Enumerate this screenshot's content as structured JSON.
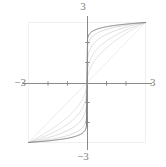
{
  "figure": {
    "title": "",
    "frame_color": "#f2f2f2",
    "axis_color": "#808080",
    "curve_color": "#c8c8c8",
    "highlight_curve_color": "#6e6e6e",
    "diagonal_color": "#e0e0e0",
    "background": "#ffffff"
  },
  "labels": {
    "x_min": "−3",
    "x_max": "3",
    "y_min": "−3",
    "y_max": "3"
  },
  "chart_data": {
    "type": "line",
    "title": "",
    "xlabel": "",
    "ylabel": "",
    "xlim": [
      -3,
      3
    ],
    "ylim": [
      -3,
      3
    ],
    "grid": false,
    "legend": null,
    "x_ticks": [
      -2,
      -1,
      1,
      2
    ],
    "y_ticks": [
      -2,
      -1,
      1,
      2
    ],
    "tick_labels_shown": [
      "-3",
      "3",
      "-3",
      "3"
    ],
    "series": [
      {
        "name": "diagonal y = x",
        "style": "solid",
        "color": "#e4e4e4",
        "width": 0.7,
        "x": [
          -3,
          3
        ],
        "values": [
          -3,
          3
        ]
      },
      {
        "name": "n = 2",
        "style": "solid",
        "color": "#d4d4d4",
        "width": 0.7,
        "exponent": 0.5,
        "x": [
          -3.0,
          -2.7,
          -2.4,
          -2.1,
          -1.8,
          -1.5,
          -1.2,
          -0.9,
          -0.6,
          -0.3,
          0.0,
          0.3,
          0.6,
          0.9,
          1.2,
          1.5,
          1.8,
          2.1,
          2.4,
          2.7,
          3.0
        ],
        "values": [
          -3.0,
          -2.846,
          -2.683,
          -2.51,
          -2.324,
          -2.121,
          -1.897,
          -1.643,
          -1.342,
          -0.949,
          0.0,
          0.949,
          1.342,
          1.643,
          1.897,
          2.121,
          2.324,
          2.51,
          2.683,
          2.846,
          3.0
        ]
      },
      {
        "name": "n = 3",
        "style": "solid",
        "color": "#cfcfcf",
        "width": 0.7,
        "exponent": 0.3333,
        "x": [
          -3.0,
          -2.7,
          -2.4,
          -2.1,
          -1.8,
          -1.5,
          -1.2,
          -0.9,
          -0.6,
          -0.3,
          0.0,
          0.3,
          0.6,
          0.9,
          1.2,
          1.5,
          1.8,
          2.1,
          2.4,
          2.7,
          3.0
        ],
        "values": [
          -3.0,
          -2.898,
          -2.786,
          -2.663,
          -2.525,
          -2.369,
          -2.188,
          -1.97,
          -1.692,
          -1.284,
          0.0,
          1.284,
          1.692,
          1.97,
          2.188,
          2.369,
          2.525,
          2.663,
          2.786,
          2.898,
          3.0
        ]
      },
      {
        "name": "n = 5",
        "style": "solid",
        "color": "#c9c9c9",
        "width": 0.7,
        "exponent": 0.2,
        "x": [
          -3.0,
          -2.7,
          -2.4,
          -2.1,
          -1.8,
          -1.5,
          -1.2,
          -0.9,
          -0.6,
          -0.3,
          0.0,
          0.3,
          0.6,
          0.9,
          1.2,
          1.5,
          1.8,
          2.1,
          2.4,
          2.7,
          3.0
        ],
        "values": [
          -3.0,
          -2.938,
          -2.869,
          -2.792,
          -2.704,
          -2.6,
          -2.475,
          -2.317,
          -2.099,
          -1.748,
          0.0,
          1.748,
          2.099,
          2.317,
          2.475,
          2.6,
          2.704,
          2.792,
          2.869,
          2.938,
          3.0
        ]
      },
      {
        "name": "n = 9",
        "style": "solid",
        "color": "#c4c4c4",
        "width": 0.7,
        "exponent": 0.1111,
        "x": [
          -3.0,
          -2.7,
          -2.4,
          -2.1,
          -1.8,
          -1.5,
          -1.2,
          -0.9,
          -0.6,
          -0.3,
          0.0,
          0.3,
          0.6,
          0.9,
          1.2,
          1.5,
          1.8,
          2.1,
          2.4,
          2.7,
          3.0
        ],
        "values": [
          -3.0,
          -2.965,
          -2.925,
          -2.88,
          -2.828,
          -2.765,
          -2.687,
          -2.585,
          -2.438,
          -2.18,
          0.0,
          2.18,
          2.438,
          2.585,
          2.687,
          2.765,
          2.828,
          2.88,
          2.925,
          2.965,
          3.0
        ]
      },
      {
        "name": "n = 15 (highlighted)",
        "style": "solid",
        "color": "#6e6e6e",
        "width": 0.9,
        "exponent": 0.0667,
        "highlighted": true,
        "x": [
          -3.0,
          -2.7,
          -2.4,
          -2.1,
          -1.8,
          -1.5,
          -1.2,
          -0.9,
          -0.6,
          -0.3,
          0.0,
          0.3,
          0.6,
          0.9,
          1.2,
          1.5,
          1.8,
          2.1,
          2.4,
          2.7,
          3.0
        ],
        "values": [
          -3.0,
          -2.979,
          -2.955,
          -2.927,
          -2.895,
          -2.855,
          -2.806,
          -2.74,
          -2.644,
          -2.468,
          0.0,
          2.468,
          2.644,
          2.74,
          2.806,
          2.855,
          2.895,
          2.927,
          2.955,
          2.979,
          3.0
        ]
      }
    ]
  }
}
